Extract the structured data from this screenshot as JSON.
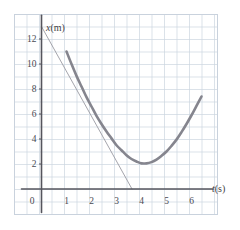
{
  "figure": {
    "name": "position-time-graph",
    "background_color": "#ffffff",
    "plot_border_color": "#c9d2dd",
    "grid_color": "#ccd6e0",
    "axis_color": "#55555d",
    "curve_color": "#85858e",
    "tangent_color": "#9a9aa2"
  },
  "axes": {
    "x_title": "t(s)",
    "y_title": "x(m)",
    "x_title_variable": "t",
    "x_title_unit": "(s)",
    "y_title_variable": "x",
    "y_title_unit": "(m)",
    "origin_label": "0",
    "x_tick_labels": [
      "1",
      "2",
      "3",
      "4",
      "5",
      "6"
    ],
    "y_tick_labels": [
      "2",
      "4",
      "6",
      "8",
      "10",
      "12"
    ]
  },
  "chart_data": {
    "type": "line",
    "title": "",
    "subtitle": "",
    "xlabel": "t(s)",
    "ylabel": "x(m)",
    "xlim": [
      0,
      7
    ],
    "ylim": [
      0,
      14
    ],
    "x_ticks": [
      0,
      1,
      2,
      3,
      4,
      5,
      6
    ],
    "y_ticks": [
      2,
      4,
      6,
      8,
      10,
      12
    ],
    "x_minor_step": 0.5,
    "y_minor_step": 1,
    "grid": true,
    "legend": null,
    "legend_position": "none",
    "series": [
      {
        "name": "position curve",
        "type": "line",
        "color": "#85858e",
        "width": 2.6,
        "x": [
          1.0,
          1.2,
          1.4,
          1.6,
          1.8,
          2.0,
          2.2,
          2.4,
          2.6,
          2.8,
          3.0,
          3.2,
          3.4,
          3.6,
          3.8,
          4.0,
          4.2,
          4.4,
          4.6,
          4.8,
          5.0,
          5.2,
          5.4,
          5.6,
          5.8,
          6.0,
          6.2,
          6.4
        ],
        "y": [
          11.0,
          10.0,
          9.05,
          8.2,
          7.35,
          6.6,
          5.85,
          5.2,
          4.6,
          4.05,
          3.5,
          3.1,
          2.7,
          2.4,
          2.2,
          2.05,
          2.05,
          2.15,
          2.35,
          2.65,
          3.0,
          3.45,
          3.95,
          4.55,
          5.2,
          5.9,
          6.65,
          7.4
        ],
        "vertex": {
          "t": 4.05,
          "x": 2.03
        },
        "start_point": {
          "t": 1.0,
          "x": 11.0
        },
        "end_point": {
          "t": 6.4,
          "x": 7.4
        }
      },
      {
        "name": "tangent line",
        "type": "line",
        "color": "#9a9aa2",
        "width": 0.9,
        "x": [
          0.0,
          3.62
        ],
        "y": [
          13.0,
          0.0
        ],
        "slope": -3.59,
        "intercept": 13.0
      }
    ],
    "annotations": []
  }
}
